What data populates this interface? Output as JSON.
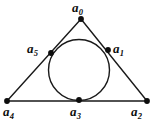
{
  "figure": {
    "stroke_color": "#1a1a1a",
    "point_color": "#0d0d0d",
    "background_color": "#ffffff",
    "triangle": {
      "vertices": [
        {
          "name": "apex",
          "x": 81,
          "y": 19
        },
        {
          "name": "bottom-right",
          "x": 147,
          "y": 101
        },
        {
          "name": "bottom-left",
          "x": 7,
          "y": 101
        }
      ]
    },
    "circle": {
      "cx": 79,
      "cy": 70,
      "r": 30.5
    },
    "points": [
      {
        "id": "a0",
        "base": "a",
        "sub": "0",
        "x": 81,
        "y": 19,
        "label_x": 72,
        "label_y": 1,
        "role": "triangle-apex-vertex"
      },
      {
        "id": "a1",
        "base": "a",
        "sub": "1",
        "x": 108,
        "y": 50,
        "label_x": 113,
        "label_y": 42,
        "role": "tangent-point-right-side"
      },
      {
        "id": "a2",
        "base": "a",
        "sub": "2",
        "x": 147,
        "y": 101,
        "label_x": 131,
        "label_y": 105,
        "role": "triangle-bottom-right-vertex"
      },
      {
        "id": "a3",
        "base": "a",
        "sub": "3",
        "x": 79,
        "y": 100,
        "label_x": 70,
        "label_y": 105,
        "role": "tangent-point-bottom-side"
      },
      {
        "id": "a4",
        "base": "a",
        "sub": "4",
        "x": 7,
        "y": 101,
        "label_x": 3,
        "label_y": 105,
        "role": "triangle-bottom-left-vertex"
      },
      {
        "id": "a5",
        "base": "a",
        "sub": "5",
        "x": 51,
        "y": 53,
        "label_x": 27,
        "label_y": 42,
        "role": "tangent-point-left-side"
      }
    ]
  }
}
